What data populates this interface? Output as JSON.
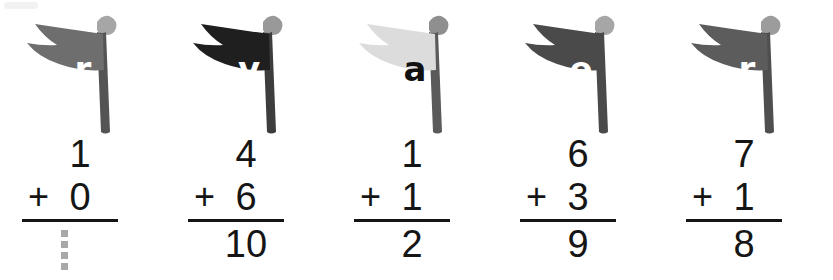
{
  "worksheet": {
    "title": "Flag addition worksheet",
    "background_color": "#ffffff",
    "ink_color": "#151515",
    "traced_color": "#a8a8a8",
    "pole_color": "#4f4f4f",
    "finial_color": "#a6a6a6",
    "problem_count": 5
  },
  "problems": [
    {
      "index": "1",
      "flag": {
        "letter": "r",
        "flag_color": "#6e6e6e",
        "letter_color": "#ffffff",
        "pole_color": "#545454",
        "finial_color": "#a6a6a6",
        "icon": "flag-pennant-icon"
      },
      "equation": {
        "top": "1",
        "operator": "+",
        "addend": "0",
        "sum": "1",
        "sum_traced": true
      }
    },
    {
      "index": "2",
      "flag": {
        "letter": "v",
        "flag_color": "#1f1f1f",
        "letter_color": "#ffffff",
        "pole_color": "#3d3d3d",
        "finial_color": "#999999",
        "icon": "flag-pennant-icon"
      },
      "equation": {
        "top": "4",
        "operator": "+",
        "addend": "6",
        "sum": "10",
        "sum_traced": false
      }
    },
    {
      "index": "3",
      "flag": {
        "letter": "a",
        "flag_color": "#dcdcdc",
        "letter_color": "#111111",
        "pole_color": "#5a5a5a",
        "finial_color": "#8f8f8f",
        "icon": "flag-pennant-icon"
      },
      "equation": {
        "top": "1",
        "operator": "+",
        "addend": "1",
        "sum": "2",
        "sum_traced": false
      }
    },
    {
      "index": "4",
      "flag": {
        "letter": "e",
        "flag_color": "#4a4a4a",
        "letter_color": "#ffffff",
        "pole_color": "#4a4a4a",
        "finial_color": "#a6a6a6",
        "icon": "flag-pennant-icon"
      },
      "equation": {
        "top": "6",
        "operator": "+",
        "addend": "3",
        "sum": "9",
        "sum_traced": false
      }
    },
    {
      "index": "5",
      "flag": {
        "letter": "r",
        "flag_color": "#5c5c5c",
        "letter_color": "#ffffff",
        "pole_color": "#4f4f4f",
        "finial_color": "#9c9c9c",
        "icon": "flag-pennant-icon"
      },
      "equation": {
        "top": "7",
        "operator": "+",
        "addend": "1",
        "sum": "8",
        "sum_traced": false
      }
    }
  ]
}
